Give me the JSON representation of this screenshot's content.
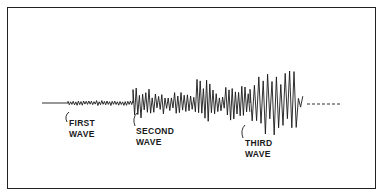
{
  "diagram": {
    "type": "seismogram",
    "labels": {
      "first": [
        "FIRST",
        "WAVE"
      ],
      "second": [
        "SECOND",
        "WAVE"
      ],
      "third": [
        "THIRD",
        "WAVE"
      ]
    },
    "colors": {
      "ink": "#1a1a1a",
      "background": "#ffffff"
    }
  }
}
